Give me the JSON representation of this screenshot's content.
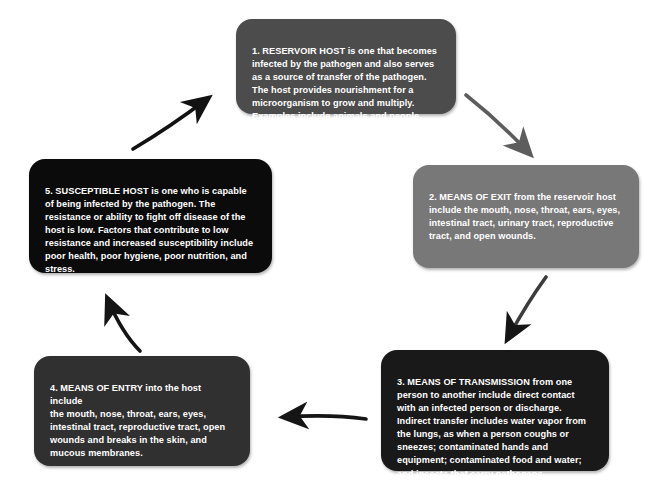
{
  "diagram": {
    "type": "cycle",
    "background_color": "#ffffff",
    "nodes": [
      {
        "id": 1,
        "name": "reservoir-host",
        "color": "#4c4c4c",
        "text": "1.  RESERVOIR HOST is one that becomes\ninfected by the pathogen and also serves\nas a source of transfer of the pathogen.\nThe host provides nourishment for a\nmicroorganism to grow and multiply.\nExamples include animals and people."
      },
      {
        "id": 2,
        "name": "means-of-exit",
        "color": "#787878",
        "text": "2.  MEANS OF EXIT from the reservoir host\ninclude the mouth, nose, throat, ears, eyes,\nintestinal tract, urinary tract, reproductive\ntract, and open wounds."
      },
      {
        "id": 3,
        "name": "means-of-transmission",
        "color": "#191919",
        "text": "3. MEANS OF TRANSMISSION from one\nperson to another include direct contact\nwith an infected person or discharge.\nIndirect transfer includes water vapor from\nthe lungs, as when a person coughs or\nsneezes; contaminated hands and\nequipment; contaminated food and water;\nand insects that carry pathogens."
      },
      {
        "id": 4,
        "name": "means-of-entry",
        "color": "#303030",
        "text": "4. MEANS OF ENTRY into the host include\nthe mouth, nose, throat, ears, eyes,\nintestinal tract, reproductive tract, open\nwounds and breaks in the skin, and\nmucous membranes."
      },
      {
        "id": 5,
        "name": "susceptible-host",
        "color": "#0b0b0b",
        "text": "5. SUSCEPTIBLE HOST is one who is capable\nof being infected by the pathogen. The\nresistance or ability to fight off disease of the\nhost is low. Factors that contribute to low\nresistance and increased susceptibility include\npoor health, poor hygiene, poor nutrition, and\nstress."
      }
    ],
    "arrows": [
      {
        "name": "arrow-reservoir-to-exit",
        "from": 1,
        "to": 2,
        "color": "#5d5d5d"
      },
      {
        "name": "arrow-exit-to-transmission",
        "from": 2,
        "to": 3,
        "color": "#3c3c3c"
      },
      {
        "name": "arrow-transmission-to-entry",
        "from": 3,
        "to": 4,
        "color": "#151515"
      },
      {
        "name": "arrow-entry-to-susceptible",
        "from": 4,
        "to": 5,
        "color": "#151515"
      },
      {
        "name": "arrow-susceptible-to-reservoir",
        "from": 5,
        "to": 1,
        "color": "#121212"
      }
    ]
  }
}
